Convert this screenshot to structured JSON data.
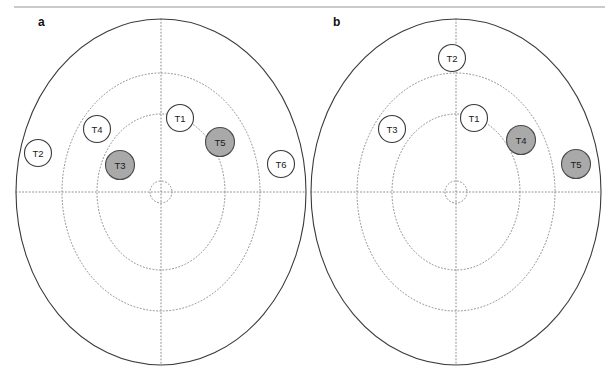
{
  "figure": {
    "width": 616,
    "height": 375,
    "background_color": "#ffffff",
    "top_rule": {
      "x1": 14,
      "x2": 605,
      "y": 7,
      "color": "#b9b9b9"
    }
  },
  "colors": {
    "outline": "#3a3a3a",
    "dotted": "#8c8c8c",
    "filled_marker": "#a9a9a9",
    "open_marker": "#ffffff",
    "label_text": "#1a1a1a",
    "rule": "#b9b9b9"
  },
  "chart_data": {
    "type": "scatter",
    "title": "",
    "subtitle": "",
    "xlabel": "",
    "ylabel": "",
    "grid": true,
    "legend_position": "none",
    "panels": [
      {
        "id": "a",
        "label": "a",
        "label_x": 38,
        "label_y": 26,
        "center": {
          "x": 161,
          "y": 192
        },
        "outer_ellipse": {
          "rx": 145,
          "ry": 173
        },
        "rings": [
          {
            "rx": 99,
            "ry": 119
          },
          {
            "rx": 64,
            "ry": 78
          }
        ],
        "center_dot": {
          "r": 11
        },
        "axes": {
          "vertical": true,
          "horizontal": true
        },
        "markers": [
          {
            "label": "T1",
            "x": 180,
            "y": 118,
            "r": 13.5,
            "fill": "open"
          },
          {
            "label": "T2",
            "x": 38,
            "y": 153,
            "r": 13.5,
            "fill": "open"
          },
          {
            "label": "T3",
            "x": 120,
            "y": 165,
            "r": 14.5,
            "fill": "filled"
          },
          {
            "label": "T4",
            "x": 97,
            "y": 129,
            "r": 13.5,
            "fill": "open"
          },
          {
            "label": "T5",
            "x": 220,
            "y": 142,
            "r": 14.5,
            "fill": "filled"
          },
          {
            "label": "T6",
            "x": 281,
            "y": 164,
            "r": 13.5,
            "fill": "open"
          }
        ]
      },
      {
        "id": "b",
        "label": "b",
        "label_x": 333,
        "label_y": 26,
        "center": {
          "x": 456,
          "y": 192
        },
        "outer_ellipse": {
          "rx": 145,
          "ry": 173
        },
        "rings": [
          {
            "rx": 99,
            "ry": 119
          },
          {
            "rx": 64,
            "ry": 78
          }
        ],
        "center_dot": {
          "r": 11
        },
        "axes": {
          "vertical": true,
          "horizontal": true
        },
        "markers": [
          {
            "label": "T1",
            "x": 474,
            "y": 118,
            "r": 13.5,
            "fill": "open"
          },
          {
            "label": "T2",
            "x": 452,
            "y": 58,
            "r": 13.5,
            "fill": "open"
          },
          {
            "label": "T3",
            "x": 392,
            "y": 129,
            "r": 13.5,
            "fill": "open"
          },
          {
            "label": "T4",
            "x": 521,
            "y": 140,
            "r": 14.5,
            "fill": "filled"
          },
          {
            "label": "T5",
            "x": 576,
            "y": 164,
            "r": 14.5,
            "fill": "filled"
          }
        ]
      }
    ]
  }
}
